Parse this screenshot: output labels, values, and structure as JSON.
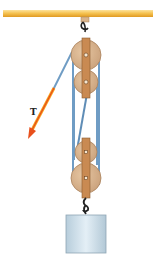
{
  "diagram": {
    "labels": {
      "tension": "T"
    },
    "components": {
      "ceiling": "ceiling-beam",
      "upper_block": {
        "pulleys": 2
      },
      "lower_block": {
        "pulleys": 2
      },
      "load": "hanging-weight",
      "force_arrow": "tension-arrow"
    },
    "colors": {
      "beam": "#f2b43a",
      "beam_highlight": "#fde29a",
      "pulley": "#d9b48c",
      "pulley_edge": "#a9825c",
      "strap": "#c98a52",
      "strap_edge": "#8a5a30",
      "rope": "#6f9cc4",
      "rope_dark": "#4f7ea8",
      "arrow_outer": "#f7a11a",
      "arrow_inner": "#e43a1c",
      "weight": "#c9dce8",
      "weight_edge": "#8fa6b5",
      "hook": "#222222"
    }
  }
}
